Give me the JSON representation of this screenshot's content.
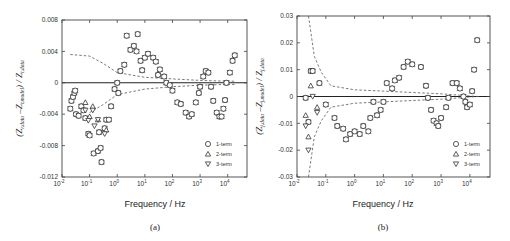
{
  "chart_data": [
    {
      "panel": "(a)",
      "type": "scatter",
      "xlabel": "Frequency / Hz",
      "ylabel": "(Z_r,data - Z_r,model) / Z_r,data",
      "xscale": "log",
      "xlim": [
        0.01,
        50000
      ],
      "ylim": [
        -0.012,
        0.008
      ],
      "xticks": [
        "10^-2",
        "10^-1",
        "10^0",
        "10^1",
        "10^2",
        "10^3",
        "10^4"
      ],
      "yticks": [
        "0.008",
        "0.004",
        "0",
        "-0.004",
        "-0.008",
        "-0.012"
      ],
      "legend": [
        "1-term",
        "2-term",
        "3-term"
      ],
      "legend_position": "lower right",
      "bounds_curve_upper": [
        [
          0.02,
          0.0036
        ],
        [
          0.1,
          0.0034
        ],
        [
          0.3,
          0.0025
        ],
        [
          1,
          0.0013
        ],
        [
          10,
          0.0007
        ],
        [
          100,
          0.0005
        ],
        [
          1000,
          0.0003
        ],
        [
          10000,
          0.0002
        ],
        [
          20000,
          0.0002
        ]
      ],
      "bounds_curve_lower": [
        [
          0.1,
          -0.0038
        ],
        [
          0.3,
          -0.0028
        ],
        [
          1,
          -0.0015
        ],
        [
          10,
          -0.0008
        ],
        [
          100,
          -0.0005
        ],
        [
          1000,
          -0.0003
        ],
        [
          10000,
          -0.0002
        ],
        [
          20000,
          -0.0002
        ]
      ],
      "series": [
        {
          "name": "1-term",
          "marker": "circle",
          "points": [
            [
              0.02,
              -0.0033
            ],
            [
              0.022,
              -0.0023
            ],
            [
              0.025,
              -0.0018
            ],
            [
              0.028,
              -0.0013
            ],
            [
              0.03,
              -0.001
            ],
            [
              0.032,
              -0.004
            ],
            [
              0.04,
              -0.0042
            ],
            [
              0.05,
              -0.003
            ],
            [
              0.06,
              -0.0035
            ],
            [
              0.07,
              -0.0045
            ],
            [
              0.09,
              -0.0065
            ],
            [
              0.1,
              -0.0067
            ],
            [
              0.14,
              -0.009
            ],
            [
              0.2,
              -0.0087
            ],
            [
              0.22,
              -0.0063
            ],
            [
              0.25,
              -0.0083
            ],
            [
              0.27,
              -0.0101
            ],
            [
              0.35,
              -0.0058
            ],
            [
              0.4,
              -0.0047
            ],
            [
              0.5,
              -0.0047
            ],
            [
              0.6,
              -0.003
            ],
            [
              0.8,
              -0.0008
            ],
            [
              1,
              0.0
            ],
            [
              1.1,
              -0.0013
            ],
            [
              1.3,
              0.0015
            ],
            [
              1.8,
              0.0023
            ],
            [
              2.2,
              0.006
            ],
            [
              3,
              0.0042
            ],
            [
              4,
              0.0047
            ],
            [
              5,
              0.004
            ],
            [
              5.5,
              0.0062
            ],
            [
              7,
              0.0028
            ],
            [
              8,
              0.0016
            ],
            [
              10,
              0.0032
            ],
            [
              13,
              0.0037
            ],
            [
              20,
              0.0032
            ],
            [
              25,
              0.0027
            ],
            [
              30,
              0.001
            ],
            [
              35,
              0.0017
            ],
            [
              50,
              0.0008
            ],
            [
              60,
              0.0
            ],
            [
              80,
              -0.0003
            ],
            [
              100,
              -0.001
            ],
            [
              150,
              -0.0025
            ],
            [
              200,
              -0.0027
            ],
            [
              300,
              -0.0038
            ],
            [
              400,
              -0.0043
            ],
            [
              500,
              -0.004
            ],
            [
              700,
              -0.0025
            ],
            [
              900,
              -0.0013
            ],
            [
              1000,
              -0.0005
            ],
            [
              1300,
              0.0008
            ],
            [
              1600,
              0.0015
            ],
            [
              2000,
              0.0013
            ],
            [
              2500,
              -0.0005
            ],
            [
              3000,
              -0.0023
            ],
            [
              4000,
              -0.0038
            ],
            [
              5000,
              -0.0043
            ],
            [
              6000,
              -0.0043
            ],
            [
              7000,
              -0.0033
            ],
            [
              8000,
              -0.0022
            ],
            [
              9000,
              0.0
            ],
            [
              12000,
              0.0013
            ],
            [
              15000,
              0.0028
            ],
            [
              18000,
              0.0035
            ]
          ]
        },
        {
          "name": "2-term",
          "marker": "triangle-up",
          "points": [
            [
              0.07,
              -0.0025
            ],
            [
              0.1,
              -0.0043
            ],
            [
              0.13,
              -0.003
            ],
            [
              0.2,
              -0.0047
            ],
            [
              0.4,
              -0.006
            ]
          ]
        },
        {
          "name": "3-term",
          "marker": "triangle-down",
          "points": [
            [
              0.07,
              -0.0035
            ],
            [
              0.09,
              -0.0048
            ],
            [
              0.13,
              -0.0035
            ],
            [
              0.15,
              -0.0055
            ],
            [
              0.2,
              -0.0047
            ],
            [
              0.35,
              -0.0065
            ]
          ]
        }
      ]
    },
    {
      "panel": "(b)",
      "type": "scatter",
      "xlabel": "Frequency / Hz",
      "ylabel": "(Z_j,data - Z_j,model) / Z_j,data",
      "xscale": "log",
      "xlim": [
        0.01,
        50000
      ],
      "ylim": [
        -0.03,
        0.03
      ],
      "xticks": [
        "10^-2",
        "10^-1",
        "10^0",
        "10^1",
        "10^2",
        "10^3",
        "10^4"
      ],
      "yticks": [
        "0.03",
        "0.02",
        "0.01",
        "0",
        "-0.01",
        "-0.02",
        "-0.03"
      ],
      "legend": [
        "1-term",
        "2-term",
        "3-term"
      ],
      "legend_position": "lower right",
      "bounds_curve_upper": [
        [
          0.025,
          0.03
        ],
        [
          0.04,
          0.015
        ],
        [
          0.07,
          0.009
        ],
        [
          0.15,
          0.004
        ],
        [
          1,
          0.0025
        ],
        [
          10,
          0.002
        ],
        [
          100,
          0.0015
        ],
        [
          1000,
          0.001
        ],
        [
          10000,
          0.0002
        ],
        [
          20000,
          0.0
        ]
      ],
      "bounds_curve_lower": [
        [
          0.025,
          -0.03
        ],
        [
          0.04,
          -0.015
        ],
        [
          0.07,
          -0.009
        ],
        [
          0.15,
          -0.004
        ],
        [
          1,
          -0.0025
        ],
        [
          10,
          -0.002
        ],
        [
          100,
          -0.0015
        ],
        [
          1000,
          -0.001
        ],
        [
          10000,
          -0.0002
        ],
        [
          20000,
          0.0
        ]
      ],
      "series": [
        {
          "name": "1-term",
          "marker": "circle",
          "points": [
            [
              0.02,
              -0.0005
            ],
            [
              0.025,
              -0.0095
            ],
            [
              0.03,
              0.0095
            ],
            [
              0.035,
              0.0095
            ],
            [
              0.06,
              0.005
            ],
            [
              0.1,
              -0.003
            ],
            [
              0.2,
              -0.008
            ],
            [
              0.25,
              -0.011
            ],
            [
              0.4,
              -0.012
            ],
            [
              0.5,
              -0.016
            ],
            [
              0.7,
              -0.014
            ],
            [
              1,
              -0.013
            ],
            [
              1.5,
              -0.014
            ],
            [
              2,
              -0.011
            ],
            [
              3,
              -0.013
            ],
            [
              3.5,
              -0.008
            ],
            [
              4.5,
              -0.002
            ],
            [
              6,
              -0.007
            ],
            [
              8,
              -0.005
            ],
            [
              10,
              -0.002
            ],
            [
              13,
              0.005
            ],
            [
              20,
              0.003
            ],
            [
              25,
              0.006
            ],
            [
              35,
              0.007
            ],
            [
              50,
              0.011
            ],
            [
              70,
              0.013
            ],
            [
              100,
              0.012
            ],
            [
              200,
              0.011
            ],
            [
              300,
              0.004
            ],
            [
              350,
              -0.0005
            ],
            [
              450,
              -0.005
            ],
            [
              550,
              -0.009
            ],
            [
              700,
              -0.01
            ],
            [
              800,
              -0.011
            ],
            [
              1000,
              -0.008
            ],
            [
              1500,
              -0.004
            ],
            [
              1800,
              -0.0005
            ],
            [
              2500,
              0.005
            ],
            [
              3500,
              0.005
            ],
            [
              4500,
              0.003
            ],
            [
              6000,
              0.0
            ],
            [
              7000,
              -0.002
            ],
            [
              8000,
              -0.004
            ],
            [
              10000,
              -0.003
            ],
            [
              12000,
              0.002
            ],
            [
              14000,
              0.01
            ],
            [
              18000,
              0.021
            ]
          ]
        },
        {
          "name": "2-term",
          "marker": "triangle-up",
          "points": [
            [
              0.02,
              -0.007
            ],
            [
              0.025,
              -0.015
            ],
            [
              0.03,
              0.004
            ],
            [
              0.05,
              -0.004
            ]
          ]
        },
        {
          "name": "3-term",
          "marker": "triangle-down",
          "points": [
            [
              0.02,
              -0.011
            ],
            [
              0.025,
              -0.02
            ],
            [
              0.035,
              0.0
            ],
            [
              0.05,
              -0.006
            ]
          ]
        }
      ]
    }
  ],
  "panels": {
    "a": {
      "label": "(a)",
      "xlabel": "Frequency / Hz",
      "ylabel_num": "Z",
      "ylabel_sub1": "r,data",
      "ylabel_sub2": "r,model",
      "ylabel_den_sub": "r,data"
    },
    "b": {
      "label": "(b)",
      "xlabel": "Frequency / Hz",
      "ylabel_num": "Z",
      "ylabel_sub1": "j,data",
      "ylabel_sub2": "j,model",
      "ylabel_den_sub": "j,data"
    }
  },
  "legend": {
    "items": [
      "1-term",
      "2-term",
      "3-term"
    ]
  }
}
